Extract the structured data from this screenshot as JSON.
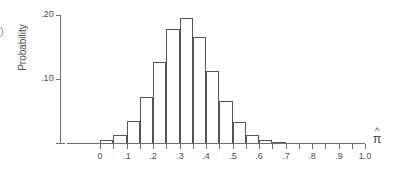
{
  "figure": {
    "edge_marker": ")",
    "x_axis_title_symbol": "π",
    "x_axis_title_hat": "^"
  },
  "chart_data": {
    "type": "bar",
    "title": "",
    "subtitle": "",
    "xlabel": "π̂",
    "ylabel": "Probability",
    "grid": false,
    "legend": "none",
    "xlim": [
      0.0,
      1.0
    ],
    "ylim": [
      0.0,
      0.2
    ],
    "bin_width": 0.05,
    "x_tick_labels": [
      "0",
      ".1",
      ".2",
      ".3",
      ".4",
      ".5",
      ".6",
      ".7",
      ".8",
      ".9",
      "1.0"
    ],
    "x_tick_values": [
      0.0,
      0.1,
      0.2,
      0.3,
      0.4,
      0.5,
      0.6,
      0.7,
      0.8,
      0.9,
      1.0
    ],
    "x_minor_tick_values": [
      0.05,
      0.15,
      0.25,
      0.35,
      0.45,
      0.55,
      0.65,
      0.75,
      0.85,
      0.95
    ],
    "y_tick_labels": [
      ".10",
      ".20"
    ],
    "y_tick_values": [
      0.1,
      0.2
    ],
    "categories": [
      "0.00-0.05",
      "0.05-0.10",
      "0.10-0.15",
      "0.15-0.20",
      "0.20-0.25",
      "0.25-0.30",
      "0.30-0.35",
      "0.35-0.40",
      "0.40-0.45",
      "0.45-0.50",
      "0.50-0.55",
      "0.55-0.60",
      "0.60-0.65",
      "0.65-0.70"
    ],
    "bin_starts": [
      0.0,
      0.05,
      0.1,
      0.15,
      0.2,
      0.25,
      0.3,
      0.35,
      0.4,
      0.45,
      0.5,
      0.55,
      0.6,
      0.65
    ],
    "values": [
      0.004,
      0.012,
      0.035,
      0.072,
      0.127,
      0.178,
      0.195,
      0.165,
      0.113,
      0.066,
      0.033,
      0.013,
      0.005,
      0.002
    ]
  }
}
